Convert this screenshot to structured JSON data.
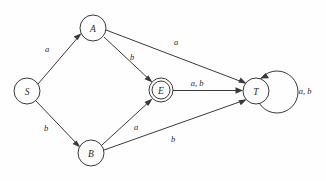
{
  "diagram": {
    "type": "state-machine",
    "background_color": "#fefefe",
    "stroke_color": "#3a3a3a",
    "states": [
      {
        "id": "S",
        "label": "S",
        "cx": 27,
        "cy": 91,
        "r": 13,
        "accepting": false
      },
      {
        "id": "A",
        "label": "A",
        "cx": 93,
        "cy": 28,
        "r": 13,
        "accepting": false
      },
      {
        "id": "B",
        "label": "B",
        "cx": 91,
        "cy": 153,
        "r": 13,
        "accepting": false
      },
      {
        "id": "E",
        "label": "E",
        "cx": 161,
        "cy": 90,
        "r": 12,
        "accepting": true,
        "inner_r": 9
      },
      {
        "id": "T",
        "label": "T",
        "cx": 256,
        "cy": 91,
        "r": 13,
        "accepting": false
      }
    ],
    "transitions": [
      {
        "from": "S",
        "to": "A",
        "label": "a",
        "label_x": 47,
        "label_y": 49
      },
      {
        "from": "S",
        "to": "B",
        "label": "b",
        "label_x": 46,
        "label_y": 128
      },
      {
        "from": "A",
        "to": "E",
        "label": "b",
        "label_x": 132,
        "label_y": 57
      },
      {
        "from": "A",
        "to": "T",
        "label": "a",
        "label_x": 176,
        "label_y": 42
      },
      {
        "from": "B",
        "to": "E",
        "label": "a",
        "label_x": 136,
        "label_y": 127
      },
      {
        "from": "B",
        "to": "T",
        "label": "b",
        "label_x": 173,
        "label_y": 139
      },
      {
        "from": "E",
        "to": "T",
        "label": "a, b",
        "label_x": 197,
        "label_y": 83
      },
      {
        "from": "T",
        "to": "T",
        "label": "a, b",
        "label_x": 305,
        "label_y": 91,
        "self_loop": true
      }
    ]
  }
}
